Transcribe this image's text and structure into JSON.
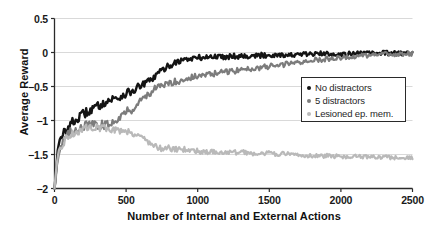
{
  "chart_data": {
    "type": "line",
    "title": "",
    "xlabel": "Number of Internal and External Actions",
    "ylabel": "Average Reward",
    "xlim": [
      0,
      2500
    ],
    "ylim": [
      -2,
      0.5
    ],
    "xticks": [
      "0",
      "500",
      "1000",
      "1500",
      "2000",
      "2500"
    ],
    "xtick_values": [
      0,
      500,
      1000,
      1500,
      2000,
      2500
    ],
    "yticks": [
      "0.5",
      "0",
      "-0.5",
      "-1",
      "-1.5",
      "-2"
    ],
    "ytick_values": [
      0.5,
      0,
      -0.5,
      -1,
      -1.5,
      -2
    ],
    "grid": "horizontal",
    "legend_position": "lower-right-inside",
    "series": [
      {
        "name": "No distractors",
        "color": "#141414",
        "x": [
          0,
          10,
          20,
          30,
          45,
          60,
          80,
          100,
          120,
          145,
          170,
          200,
          230,
          260,
          290,
          320,
          350,
          380,
          410,
          440,
          470,
          500,
          530,
          560,
          590,
          620,
          650,
          680,
          710,
          740,
          780,
          820,
          860,
          900,
          950,
          1000,
          1060,
          1120,
          1180,
          1250,
          1320,
          1400,
          1480,
          1560,
          1650,
          1740,
          1830,
          1920,
          2010,
          2100,
          2200,
          2300,
          2400,
          2500
        ],
        "y": [
          -2.0,
          -1.72,
          -1.5,
          -1.38,
          -1.28,
          -1.2,
          -1.14,
          -1.09,
          -1.04,
          -1.0,
          -0.96,
          -0.91,
          -0.87,
          -0.84,
          -0.8,
          -0.77,
          -0.73,
          -0.71,
          -0.68,
          -0.67,
          -0.64,
          -0.6,
          -0.58,
          -0.55,
          -0.5,
          -0.47,
          -0.44,
          -0.39,
          -0.34,
          -0.28,
          -0.22,
          -0.17,
          -0.13,
          -0.11,
          -0.09,
          -0.08,
          -0.07,
          -0.06,
          -0.06,
          -0.05,
          -0.05,
          -0.05,
          -0.04,
          -0.03,
          -0.04,
          -0.03,
          -0.02,
          -0.02,
          -0.02,
          -0.02,
          -0.01,
          -0.01,
          -0.01,
          -0.01
        ]
      },
      {
        "name": "5 distractors",
        "color": "#7c7c7c",
        "x": [
          0,
          10,
          20,
          30,
          45,
          60,
          80,
          100,
          125,
          150,
          180,
          210,
          240,
          270,
          300,
          330,
          360,
          390,
          420,
          450,
          480,
          510,
          540,
          570,
          600,
          630,
          660,
          700,
          740,
          780,
          820,
          860,
          900,
          950,
          1000,
          1060,
          1120,
          1180,
          1250,
          1320,
          1400,
          1480,
          1560,
          1650,
          1740,
          1830,
          1920,
          2010,
          2100,
          2200,
          2300,
          2400,
          2500
        ],
        "y": [
          -2.0,
          -1.78,
          -1.6,
          -1.48,
          -1.38,
          -1.32,
          -1.25,
          -1.2,
          -1.16,
          -1.12,
          -1.1,
          -1.08,
          -1.07,
          -1.06,
          -1.09,
          -1.06,
          -1.07,
          -1.04,
          -1.0,
          -0.95,
          -0.9,
          -0.86,
          -0.84,
          -0.78,
          -0.71,
          -0.65,
          -0.6,
          -0.54,
          -0.5,
          -0.47,
          -0.44,
          -0.42,
          -0.4,
          -0.37,
          -0.35,
          -0.33,
          -0.31,
          -0.29,
          -0.27,
          -0.25,
          -0.23,
          -0.21,
          -0.19,
          -0.16,
          -0.13,
          -0.11,
          -0.09,
          -0.07,
          -0.06,
          -0.04,
          -0.03,
          -0.02,
          -0.02
        ]
      },
      {
        "name": "Lesioned ep. mem.",
        "color": "#b9b9b9",
        "x": [
          0,
          10,
          20,
          30,
          45,
          60,
          80,
          100,
          125,
          150,
          180,
          210,
          240,
          270,
          300,
          330,
          360,
          390,
          420,
          450,
          480,
          510,
          540,
          570,
          600,
          630,
          660,
          700,
          740,
          780,
          820,
          860,
          900,
          950,
          1000,
          1060,
          1120,
          1180,
          1250,
          1320,
          1400,
          1480,
          1560,
          1650,
          1740,
          1830,
          1920,
          2010,
          2100,
          2200,
          2300,
          2400,
          2500
        ],
        "y": [
          -2.0,
          -1.8,
          -1.62,
          -1.5,
          -1.4,
          -1.33,
          -1.27,
          -1.23,
          -1.2,
          -1.18,
          -1.14,
          -1.12,
          -1.1,
          -1.09,
          -1.1,
          -1.11,
          -1.12,
          -1.12,
          -1.14,
          -1.15,
          -1.13,
          -1.16,
          -1.18,
          -1.2,
          -1.23,
          -1.27,
          -1.32,
          -1.38,
          -1.41,
          -1.39,
          -1.42,
          -1.43,
          -1.42,
          -1.44,
          -1.45,
          -1.46,
          -1.46,
          -1.47,
          -1.47,
          -1.47,
          -1.48,
          -1.48,
          -1.49,
          -1.5,
          -1.51,
          -1.52,
          -1.52,
          -1.53,
          -1.53,
          -1.54,
          -1.54,
          -1.55,
          -1.55
        ]
      }
    ]
  },
  "legend": {
    "items": [
      {
        "label": "No distractors",
        "color": "#141414"
      },
      {
        "label": "5 distractors",
        "color": "#7c7c7c"
      },
      {
        "label": "Lesioned ep. mem.",
        "color": "#b9b9b9"
      }
    ]
  },
  "axes": {
    "y_label": "Average Reward",
    "x_label": "Number of Internal and External Actions",
    "y_ticks": [
      "0.5",
      "0",
      "-0.5",
      "-1",
      "-1.5",
      "-2"
    ],
    "x_ticks": [
      "0",
      "500",
      "1000",
      "1500",
      "2000",
      "2500"
    ]
  },
  "colors": {
    "axis": "#2a2a2a",
    "grid": "#c8c8c8",
    "background": "#ffffff"
  }
}
